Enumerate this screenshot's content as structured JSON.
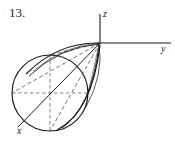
{
  "figure": {
    "problem_number": "13.",
    "background_color": "#ffffff",
    "stroke_color": "#1b1b1b",
    "dashed_color": "#555555",
    "width": 175,
    "height": 150
  },
  "axes": {
    "z": {
      "label": "z",
      "label_x": 103,
      "label_y": 9,
      "from_x": 100,
      "from_y": 14,
      "to_x": 100,
      "to_y": 44
    },
    "y": {
      "label": "y",
      "label_x": 161,
      "label_y": 44,
      "from_x": 100,
      "from_y": 43,
      "to_x": 171,
      "to_y": 43
    },
    "x": {
      "label": "x",
      "label_x": 17,
      "label_y": 126,
      "from_x": 100,
      "from_y": 43,
      "to_x": 18,
      "to_y": 127
    },
    "origin_x": 100,
    "origin_y": 43
  },
  "solid": {
    "type": "cone",
    "apex_x": 100,
    "apex_y": 43,
    "base_center_x": 50,
    "base_center_y": 93,
    "base_radius": 38,
    "base_shape": "circle",
    "base_center_dash_horizontal": true,
    "base_center_dash_vertical": true,
    "silhouette_lines": 3,
    "hidden_edges_dashed": true
  },
  "chart_data": {
    "type": "diagram",
    "title": "13.",
    "labels": [
      "x",
      "y",
      "z"
    ],
    "geometry": "cone",
    "apex": [
      100,
      43
    ],
    "base_center": [
      50,
      93
    ],
    "base_radius": 38
  }
}
